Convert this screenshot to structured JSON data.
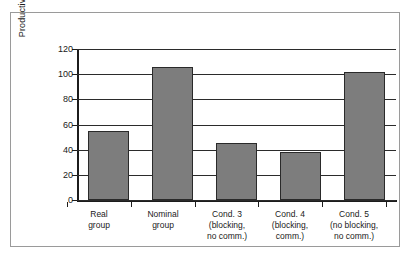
{
  "chart_data": {
    "type": "bar",
    "title": "",
    "xlabel": "",
    "ylabel": "Productivity (no. of ideas)",
    "ylim": [
      0,
      120
    ],
    "ytick_step": 20,
    "yticks": [
      "120",
      "100",
      "80",
      "60",
      "40",
      "20",
      "0"
    ],
    "grid": true,
    "legend": "none",
    "bar_color": "#7d7d7d",
    "bar_border_color": "#2a2a2a",
    "categories": [
      "Real\ngroup",
      "Nominal\ngroup",
      "Cond. 3\n(blocking,\nno comm.)",
      "Cond. 4\n(blocking,\ncomm.)",
      "Cond. 5\n(no blocking,\nno comm.)"
    ],
    "values": [
      55,
      106,
      45,
      38,
      102
    ]
  }
}
